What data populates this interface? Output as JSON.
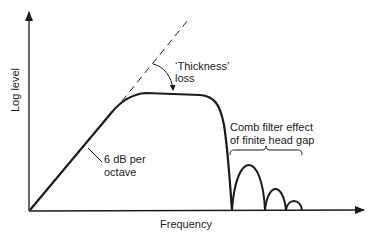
{
  "diagram": {
    "axes": {
      "x_label": "Frequency",
      "y_label": "Log level"
    },
    "annotations": {
      "slope_line1": "6 dB per",
      "slope_line2": "octave",
      "thickness_line1": "‘Thickness’",
      "thickness_line2": "loss",
      "comb_line1": "Comb filter effect",
      "comb_line2": "of finite head gap"
    },
    "colors": {
      "ink": "#1a1a1a",
      "background": "#ffffff"
    }
  }
}
